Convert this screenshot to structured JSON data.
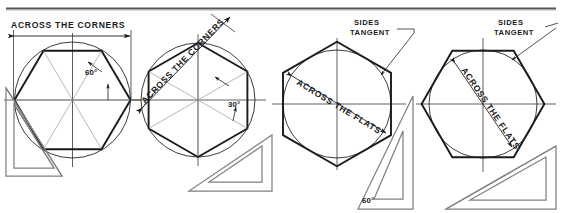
{
  "figure": {
    "title_rule": "horizontal-divider-rule",
    "background": "#ffffff",
    "ink": "#1a1a1a",
    "thin_ink": "#6e6e6e"
  },
  "panels": [
    {
      "id": "hexagon-across-corners-flat-top",
      "dimension_label": "ACROSS THE CORNERS",
      "angle_label": "60°",
      "hexagon_type": "inscribed",
      "orientation": "flat-top",
      "triangle_label": "",
      "triangle_position": "lower-left"
    },
    {
      "id": "hexagon-across-corners-vertex-top",
      "dimension_label": "ACROSS THE CORNERS",
      "angle_label": "30°",
      "hexagon_type": "inscribed",
      "orientation": "vertex-top",
      "triangle_label": "",
      "triangle_position": "lower-right"
    },
    {
      "id": "hexagon-across-flats-flat-top",
      "dimension_label": "ACROSS THE FLATS",
      "note_label_line1": "SIDES",
      "note_label_line2": "TANGENT",
      "angle_label": "60°",
      "hexagon_type": "circumscribed",
      "orientation": "flat-top",
      "triangle_position": "lower-right"
    },
    {
      "id": "hexagon-across-flats-vertex-top",
      "dimension_label": "ACROSS THE FLATS",
      "note_label_line1": "SIDES",
      "note_label_line2": "TANGENT",
      "hexagon_type": "circumscribed",
      "orientation": "vertex-top",
      "triangle_position": "lower-right"
    }
  ],
  "text": {
    "across_corners_1": "ACROSS THE CORNERS",
    "across_corners_2": "ACROSS THE CORNERS",
    "across_flats_3": "ACROSS THE FLATS",
    "across_flats_4": "ACROSS THE FLATS",
    "sides_1": "SIDES",
    "tangent_1": "TANGENT",
    "sides_2": "SIDES",
    "tangent_2": "TANGENT",
    "angle_60_p1": "60°",
    "angle_30_p2": "30°",
    "angle_60_p3": "60°"
  }
}
